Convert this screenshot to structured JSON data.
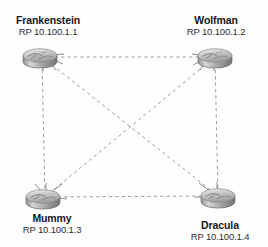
{
  "diagram": {
    "type": "network-topology",
    "background_color": "#fefefe",
    "link_style": "dashed",
    "link_color": "#9a9a9a",
    "nodes": [
      {
        "id": "frankenstein",
        "name": "Frankenstein",
        "rp": "RP 10.100.1.1",
        "icon": "router-icon",
        "x": 42,
        "y": 57
      },
      {
        "id": "wolfman",
        "name": "Wolfman",
        "rp": "RP 10.100.1.2",
        "icon": "router-icon",
        "x": 215,
        "y": 57
      },
      {
        "id": "mummy",
        "name": "Mummy",
        "rp": "RP 10.100.1.3",
        "icon": "router-icon",
        "x": 45,
        "y": 197
      },
      {
        "id": "dracula",
        "name": "Dracula",
        "rp": "RP 10.100.1.4",
        "icon": "router-icon",
        "x": 218,
        "y": 196
      }
    ],
    "links": [
      {
        "from": "frankenstein",
        "to": "wolfman",
        "style": "dashed"
      },
      {
        "from": "frankenstein",
        "to": "mummy",
        "style": "dashed"
      },
      {
        "from": "frankenstein",
        "to": "dracula",
        "style": "dashed"
      },
      {
        "from": "wolfman",
        "to": "mummy",
        "style": "dashed"
      },
      {
        "from": "wolfman",
        "to": "dracula",
        "style": "dashed"
      },
      {
        "from": "mummy",
        "to": "dracula",
        "style": "dashed"
      }
    ]
  }
}
